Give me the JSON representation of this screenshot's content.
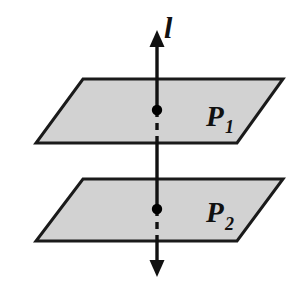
{
  "figure": {
    "kind": "geometry-diagram",
    "background_color": "#ffffff"
  },
  "colors": {
    "background": "#ffffff",
    "plane_fill": "#d2d2d2",
    "plane_stroke": "#1a1a1a",
    "line_stroke": "#111111",
    "label_color": "#111111",
    "point_fill": "#000000"
  },
  "line": {
    "label": "l",
    "label_x": 164,
    "label_y": 38,
    "x": 157,
    "top_arrow_tip_y": 30,
    "bottom_arrow_tip_y": 277,
    "stroke_width": 3.4,
    "arrow_head_width": 15,
    "arrow_head_length": 17
  },
  "planes": [
    {
      "name": "P1",
      "label_main": "P",
      "label_sub": "1",
      "label_x": 206,
      "label_y": 126,
      "points": "83,79 283,79 237,143 36,143",
      "top_y": 79,
      "bottom_y": 143,
      "stroke_width": 3.0
    },
    {
      "name": "P2",
      "label_main": "P",
      "label_sub": "2",
      "label_x": 206,
      "label_y": 226,
      "points": "83,179 283,179 237,241 36,241",
      "top_y": 179,
      "bottom_y": 241,
      "stroke_width": 3.0
    }
  ],
  "intersection_points": [
    {
      "name": "point-on-P1",
      "cx": 157,
      "cy": 110,
      "r": 5.2
    },
    {
      "name": "point-on-P2",
      "cx": 157,
      "cy": 209,
      "r": 5.2
    }
  ],
  "line_segments": [
    {
      "name": "segment-above-P1",
      "x": 157,
      "y1": 44,
      "y2": 110,
      "style": "solid"
    },
    {
      "name": "segment-inside-P1",
      "x": 157,
      "y1": 110,
      "y2": 143,
      "style": "dashed"
    },
    {
      "name": "segment-between-planes",
      "x": 157,
      "y1": 143,
      "y2": 179,
      "style": "solid"
    },
    {
      "name": "segment-above-point-P2",
      "x": 157,
      "y1": 179,
      "y2": 209,
      "style": "solid"
    },
    {
      "name": "segment-inside-P2",
      "x": 157,
      "y1": 209,
      "y2": 241,
      "style": "dashed"
    },
    {
      "name": "segment-below-P2",
      "x": 157,
      "y1": 241,
      "y2": 263,
      "style": "solid"
    }
  ],
  "dash_pattern": "7,6"
}
